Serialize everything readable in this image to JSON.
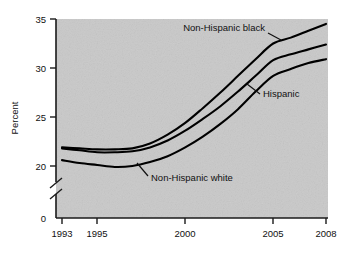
{
  "chart_data": {
    "type": "line",
    "title": "",
    "subtitle": "",
    "xlabel": "",
    "ylabel": "Percent",
    "xlim": [
      1993,
      2008
    ],
    "ylim": [
      19,
      35
    ],
    "yaxis_zero_tick": "0",
    "yaxis_break": true,
    "grid": false,
    "legend_position": "inline-annotations",
    "xticks": [
      "1993",
      "1995",
      "2000",
      "2005",
      "2008"
    ],
    "xtick_values": [
      1993,
      1995,
      2000,
      2005,
      2008
    ],
    "yticks": [
      "0",
      "20",
      "25",
      "30",
      "35"
    ],
    "ytick_values": [
      0,
      20,
      25,
      30,
      35
    ],
    "x": [
      1993,
      1994,
      1995,
      1996,
      1997,
      1998,
      1999,
      2000,
      2001,
      2002,
      2003,
      2004,
      2005,
      2006,
      2007,
      2008
    ],
    "series": [
      {
        "name": "Non-Hispanic black",
        "color": "#000000",
        "values": [
          21.9,
          21.8,
          21.7,
          21.7,
          21.8,
          22.3,
          23.2,
          24.4,
          25.9,
          27.5,
          29.2,
          30.9,
          32.5,
          33.1,
          33.8,
          34.5
        ]
      },
      {
        "name": "Hispanic",
        "color": "#000000",
        "values": [
          21.8,
          21.6,
          21.4,
          21.4,
          21.5,
          21.9,
          22.6,
          23.6,
          24.8,
          26.1,
          27.6,
          29.2,
          30.8,
          31.4,
          31.9,
          32.4
        ]
      },
      {
        "name": "Non-Hispanic white",
        "color": "#000000",
        "values": [
          20.6,
          20.3,
          20.1,
          19.9,
          20.0,
          20.4,
          21.0,
          21.9,
          23.0,
          24.3,
          25.8,
          27.6,
          29.2,
          29.9,
          30.5,
          30.9
        ]
      }
    ],
    "annotations": [
      {
        "text": "Non-Hispanic black",
        "target_series": "Non-Hispanic black"
      },
      {
        "text": "Hispanic",
        "target_series": "Hispanic"
      },
      {
        "text": "Non-Hispanic white",
        "target_series": "Non-Hispanic white"
      }
    ]
  },
  "style": {
    "plot_background": "#c9c9c9",
    "page_background": "#ffffff",
    "line_color": "#000000",
    "axis_color": "#1a1a1a",
    "text_color": "#111111"
  }
}
